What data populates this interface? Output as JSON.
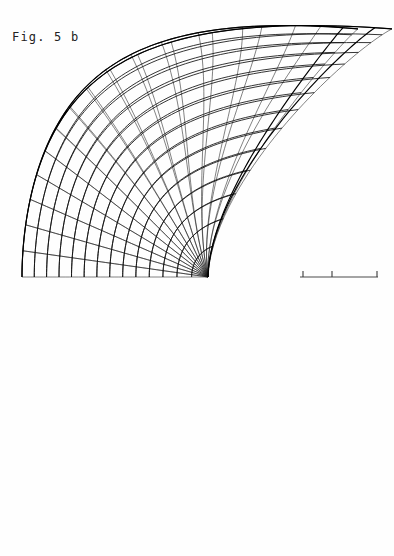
{
  "figure": {
    "caption": "Fig. 5 b",
    "background_color": "#fefefe",
    "line_color": "#111111",
    "axis_color": "#4a4a4a",
    "width_px": 394,
    "height_px": 556
  },
  "chart_data": {
    "type": "line",
    "title": "Fig. 5 b",
    "subtitle": "",
    "xlabel": "",
    "ylabel": "",
    "grid": false,
    "legend": null,
    "symmetry_axis_y": 277,
    "xlim": [
      0,
      394
    ],
    "ylim": [
      556,
      0
    ],
    "mesh": {
      "u_count": 31,
      "v_count": 14,
      "apex_top": [
        205,
        25
      ],
      "apex_bottom": [
        205,
        528
      ],
      "cusp_point": [
        208,
        276
      ],
      "left_extent_x": 25,
      "right_extent_x": 338,
      "upper_lobe_peak": [
        291,
        208
      ],
      "lower_lobe_peak": [
        338,
        334
      ]
    },
    "axis": {
      "x_start": 300,
      "x_end": 378,
      "y": 277,
      "ticks_x": [
        303,
        332,
        377
      ],
      "tick_height": 6,
      "tick_labels": [
        "",
        "",
        ""
      ]
    },
    "series": [
      {
        "name": "u-curves",
        "role": "meridian family",
        "count": 31,
        "stroke_width": 0.55
      },
      {
        "name": "v-curves",
        "role": "parallel family",
        "count": 14,
        "stroke_width": 0.85
      },
      {
        "name": "silhouette",
        "role": "outer rim / fold edge",
        "count": 2,
        "stroke_width": 1.15
      }
    ],
    "profile_radius_by_angle": {
      "angles_deg": [
        0,
        15,
        30,
        45,
        60,
        75,
        90,
        105,
        120,
        135,
        150,
        165,
        180
      ],
      "note": "radial half-width of the fan measured from the cusp toward the left"
    }
  }
}
